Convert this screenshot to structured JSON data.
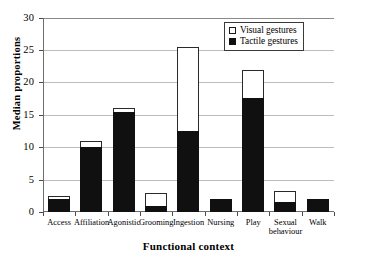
{
  "chart_data": {
    "type": "bar",
    "stacked": true,
    "title": "",
    "xlabel": "Functional context",
    "ylabel": "Median proportions",
    "ylim": [
      0,
      30
    ],
    "yticks": [
      0,
      5,
      10,
      15,
      20,
      25,
      30
    ],
    "ytick_labels": [
      "0",
      "5",
      "10",
      "15",
      "20",
      "25",
      "30"
    ],
    "grid": "horizontal",
    "legend_position": "top-right",
    "categories": [
      "Access",
      "Affiliation",
      "Agonistic",
      "Grooming",
      "Ingestion",
      "Nursing",
      "Play",
      "Sexual behaviour",
      "Walk"
    ],
    "category_label_lines": [
      [
        "Access"
      ],
      [
        "Affiliation"
      ],
      [
        "Agonistic"
      ],
      [
        "Grooming"
      ],
      [
        "Ingestion"
      ],
      [
        "Nursing"
      ],
      [
        "Play"
      ],
      [
        "Sexual",
        "behaviour"
      ],
      [
        "Walk"
      ]
    ],
    "series": [
      {
        "name": "Tactile gestures",
        "color": "#101010",
        "values": [
          2.0,
          10.0,
          15.5,
          1.0,
          12.5,
          2.0,
          17.7,
          1.5,
          2.0
        ]
      },
      {
        "name": "Visual gestures",
        "color": "#ffffff",
        "values": [
          0.5,
          1.0,
          0.6,
          2.0,
          13.0,
          0.0,
          4.3,
          1.7,
          0.0
        ]
      }
    ],
    "totals": [
      2.5,
      11.0,
      16.1,
      3.0,
      25.5,
      2.0,
      22.0,
      3.2,
      2.0
    ]
  },
  "legend": {
    "items": [
      {
        "label": "Visual gestures",
        "swatch": "open-square",
        "color": "#ffffff"
      },
      {
        "label": "Tactile gestures",
        "swatch": "filled-square",
        "color": "#101010"
      }
    ]
  },
  "axes": {
    "y_title": "Median proportions",
    "x_title": "Functional context"
  }
}
